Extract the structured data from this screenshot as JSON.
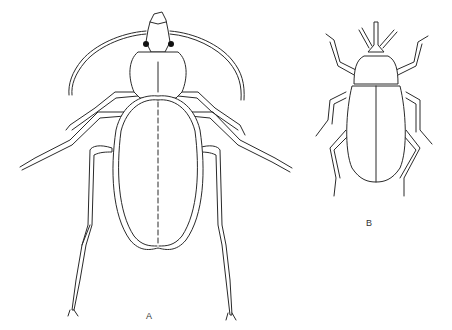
{
  "figure": {
    "panels": [
      {
        "id": "A",
        "label": "A",
        "subject": "ground beetle (carabid), dorsal view"
      },
      {
        "id": "B",
        "label": "B",
        "subject": "weevil (curculionid), dorsal view"
      }
    ],
    "colors": {
      "line": "#2a2a2a",
      "background": "#ffffff"
    }
  }
}
